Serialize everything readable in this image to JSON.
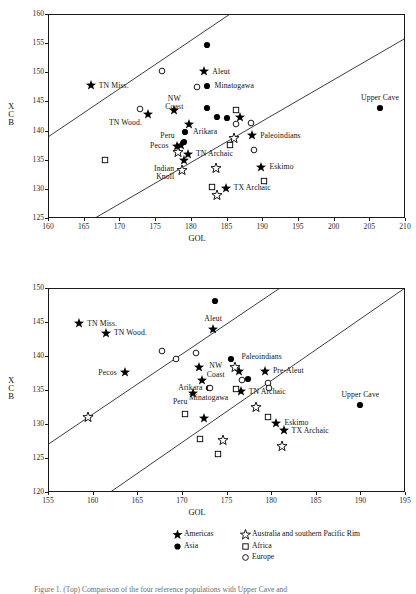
{
  "figure": {
    "caption_partial": "Figure 1. (Top) Comparison of the four reference populations with Upper Cave and"
  },
  "legend": {
    "entries": [
      {
        "label": "Americas",
        "marker": "filled-star",
        "color": "#000000"
      },
      {
        "label": "Asia",
        "marker": "filled-circle",
        "color": "#000000"
      },
      {
        "label": "Australia and southern Pacific Rim",
        "marker": "open-star",
        "color": "#000000"
      },
      {
        "label": "Africa",
        "marker": "open-square",
        "color": "#000000"
      },
      {
        "label": "Europe",
        "marker": "open-circle",
        "color": "#000000"
      }
    ]
  },
  "chart_data": [
    {
      "type": "scatter",
      "id": "top-panel",
      "title": "",
      "xlabel": "GOL",
      "ylabel": "XCB",
      "xlim": [
        160,
        210
      ],
      "ylim": [
        125,
        160
      ],
      "xticks": [
        160,
        165,
        170,
        175,
        180,
        185,
        190,
        195,
        200,
        205,
        210
      ],
      "yticks": [
        125,
        130,
        135,
        140,
        145,
        150,
        155,
        160
      ],
      "grid": false,
      "legend_position": "below-figure",
      "reference_lines": [
        {
          "name": "upper-boundary",
          "x0": 160,
          "y0": 138.9,
          "x1": 185.5,
          "y1": 160.0
        },
        {
          "name": "lower-boundary",
          "x0": 166.6,
          "y0": 125.0,
          "x1": 210.0,
          "y1": 155.8
        }
      ],
      "series": [
        {
          "name": "Americas",
          "marker": "filled-star",
          "points": [
            {
              "x": 166.0,
              "y": 147.8,
              "label": "TN Miss.",
              "label_pos": "right"
            },
            {
              "x": 174.0,
              "y": 142.8,
              "label": "TN Wood.",
              "label_pos": "belowleft"
            },
            {
              "x": 181.9,
              "y": 150.2,
              "label": "Aleut",
              "label_pos": "right"
            },
            {
              "x": 177.7,
              "y": 143.5,
              "label": "NW Coast",
              "label_pos": "above"
            },
            {
              "x": 186.9,
              "y": 142.3,
              "label": "Pre-Aleut",
              "label_pos": "none"
            },
            {
              "x": 188.6,
              "y": 139.2,
              "label": "Paleoindians",
              "label_pos": "right"
            },
            {
              "x": 179.7,
              "y": 141.1,
              "label": "",
              "label_pos": "none"
            },
            {
              "x": 178.0,
              "y": 137.4,
              "label": "Pecos",
              "label_pos": "left"
            },
            {
              "x": 178.6,
              "y": 137.5,
              "label": "Peru",
              "label_pos": "aboveleft"
            },
            {
              "x": 179.6,
              "y": 136.0,
              "label": "TN Archaic",
              "label_pos": "right"
            },
            {
              "x": 179.1,
              "y": 134.9,
              "label": "",
              "label_pos": "none"
            },
            {
              "x": 189.9,
              "y": 133.8,
              "label": "Eskimo",
              "label_pos": "right"
            },
            {
              "x": 184.9,
              "y": 130.2,
              "label": "TX Archaic",
              "label_pos": "right"
            }
          ]
        },
        {
          "name": "Asia",
          "marker": "filled-circle",
          "points": [
            {
              "x": 182.3,
              "y": 154.7,
              "label": "",
              "label_pos": "none"
            },
            {
              "x": 182.2,
              "y": 147.7,
              "label": "Minatogawa",
              "label_pos": "right"
            },
            {
              "x": 182.2,
              "y": 143.8,
              "label": "",
              "label_pos": "none"
            },
            {
              "x": 183.7,
              "y": 142.3,
              "label": "",
              "label_pos": "none"
            },
            {
              "x": 185.0,
              "y": 142.2,
              "label": "",
              "label_pos": "none"
            },
            {
              "x": 179.2,
              "y": 139.8,
              "label": "Arikara",
              "label_pos": "right"
            },
            {
              "x": 179.1,
              "y": 138.1,
              "label": "",
              "label_pos": "none"
            },
            {
              "x": 206.5,
              "y": 143.9,
              "label": "Upper Cave",
              "label_pos": "above"
            }
          ]
        },
        {
          "name": "Australia and southern Pacific Rim",
          "marker": "open-star",
          "points": [
            {
              "x": 178.2,
              "y": 136.4,
              "label": "",
              "label_pos": "none"
            },
            {
              "x": 178.8,
              "y": 133.3,
              "label": "Indian Knoll",
              "label_pos": "left"
            },
            {
              "x": 186.0,
              "y": 138.8,
              "label": "",
              "label_pos": "none"
            },
            {
              "x": 183.5,
              "y": 133.5,
              "label": "",
              "label_pos": "none"
            },
            {
              "x": 183.6,
              "y": 128.9,
              "label": "",
              "label_pos": "none"
            }
          ]
        },
        {
          "name": "Africa",
          "marker": "open-square",
          "points": [
            {
              "x": 168.0,
              "y": 134.9,
              "label": "",
              "label_pos": "none"
            },
            {
              "x": 186.4,
              "y": 143.6,
              "label": "",
              "label_pos": "none"
            },
            {
              "x": 185.5,
              "y": 137.5,
              "label": "",
              "label_pos": "none"
            },
            {
              "x": 190.2,
              "y": 131.4,
              "label": "",
              "label_pos": "none"
            },
            {
              "x": 183.0,
              "y": 130.3,
              "label": "",
              "label_pos": "none"
            }
          ]
        },
        {
          "name": "Europe",
          "marker": "open-circle",
          "points": [
            {
              "x": 176.0,
              "y": 150.3,
              "label": "",
              "label_pos": "none"
            },
            {
              "x": 180.9,
              "y": 147.4,
              "label": "",
              "label_pos": "none"
            },
            {
              "x": 172.9,
              "y": 143.7,
              "label": "",
              "label_pos": "none"
            },
            {
              "x": 186.3,
              "y": 141.1,
              "label": "",
              "label_pos": "none"
            },
            {
              "x": 188.4,
              "y": 141.3,
              "label": "",
              "label_pos": "none"
            },
            {
              "x": 188.8,
              "y": 136.7,
              "label": "",
              "label_pos": "none"
            }
          ]
        }
      ]
    },
    {
      "type": "scatter",
      "id": "bottom-panel",
      "title": "",
      "xlabel": "GOL",
      "ylabel": "XCB",
      "xlim": [
        155,
        195
      ],
      "ylim": [
        120,
        150
      ],
      "xticks": [
        155,
        160,
        165,
        170,
        175,
        180,
        185,
        190,
        195
      ],
      "yticks": [
        120,
        125,
        130,
        135,
        140,
        145,
        150
      ],
      "grid": false,
      "legend_position": "below",
      "reference_lines": [
        {
          "name": "upper-boundary",
          "x0": 155.0,
          "y0": 127.0,
          "x1": 181.0,
          "y1": 150.0
        },
        {
          "name": "lower-boundary",
          "x0": 162.0,
          "y0": 120.0,
          "x1": 195.0,
          "y1": 150.0
        }
      ],
      "series": [
        {
          "name": "Americas",
          "marker": "filled-star",
          "points": [
            {
              "x": 158.5,
              "y": 144.8,
              "label": "TN Miss.",
              "label_pos": "right"
            },
            {
              "x": 161.5,
              "y": 143.4,
              "label": "TN Wood.",
              "label_pos": "right"
            },
            {
              "x": 173.5,
              "y": 143.9,
              "label": "Aleut",
              "label_pos": "above"
            },
            {
              "x": 171.9,
              "y": 138.4,
              "label": "NW Coast",
              "label_pos": "right"
            },
            {
              "x": 163.6,
              "y": 137.6,
              "label": "Pecos",
              "label_pos": "left"
            },
            {
              "x": 172.2,
              "y": 136.4,
              "label": "",
              "label_pos": "none"
            },
            {
              "x": 171.3,
              "y": 134.6,
              "label": "Peru",
              "label_pos": "belowleft"
            },
            {
              "x": 176.4,
              "y": 137.8,
              "label": "",
              "label_pos": "none"
            },
            {
              "x": 179.3,
              "y": 137.8,
              "label": "Pre-Aleut",
              "label_pos": "right"
            },
            {
              "x": 176.6,
              "y": 134.8,
              "label": "TN Archaic",
              "label_pos": "right"
            },
            {
              "x": 172.5,
              "y": 130.9,
              "label": "",
              "label_pos": "none"
            },
            {
              "x": 180.6,
              "y": 130.2,
              "label": "Eskimo",
              "label_pos": "right"
            },
            {
              "x": 181.4,
              "y": 129.1,
              "label": "TX Archaic",
              "label_pos": "right"
            }
          ]
        },
        {
          "name": "Asia",
          "marker": "filled-circle",
          "points": [
            {
              "x": 173.7,
              "y": 148.1,
              "label": "",
              "label_pos": "none"
            },
            {
              "x": 175.5,
              "y": 139.6,
              "label": "",
              "label_pos": "none"
            },
            {
              "x": 177.4,
              "y": 136.6,
              "label": "",
              "label_pos": "none"
            },
            {
              "x": 173.0,
              "y": 135.3,
              "label": "Minatogawa",
              "label_pos": "below"
            },
            {
              "x": 190.0,
              "y": 132.8,
              "label": "Upper Cave",
              "label_pos": "above"
            }
          ]
        },
        {
          "name": "Australia and southern Pacific Rim",
          "marker": "open-star",
          "points": [
            {
              "x": 159.5,
              "y": 131.1,
              "label": "",
              "label_pos": "none"
            },
            {
              "x": 176.0,
              "y": 138.4,
              "label": "Paleoindians",
              "label_pos": "aboveright"
            },
            {
              "x": 178.3,
              "y": 132.5,
              "label": "",
              "label_pos": "none"
            },
            {
              "x": 174.6,
              "y": 127.7,
              "label": "",
              "label_pos": "none"
            },
            {
              "x": 181.2,
              "y": 126.7,
              "label": "",
              "label_pos": "none"
            }
          ]
        },
        {
          "name": "Africa",
          "marker": "open-square",
          "points": [
            {
              "x": 170.3,
              "y": 131.5,
              "label": "",
              "label_pos": "none"
            },
            {
              "x": 176.1,
              "y": 135.2,
              "label": "",
              "label_pos": "none"
            },
            {
              "x": 179.6,
              "y": 131.1,
              "label": "",
              "label_pos": "none"
            },
            {
              "x": 172.0,
              "y": 127.8,
              "label": "",
              "label_pos": "none"
            },
            {
              "x": 174.0,
              "y": 125.6,
              "label": "",
              "label_pos": "none"
            }
          ]
        },
        {
          "name": "Europe",
          "marker": "open-circle",
          "points": [
            {
              "x": 167.8,
              "y": 140.7,
              "label": "",
              "label_pos": "none"
            },
            {
              "x": 171.6,
              "y": 140.4,
              "label": "",
              "label_pos": "none"
            },
            {
              "x": 169.3,
              "y": 139.5,
              "label": "",
              "label_pos": "none"
            },
            {
              "x": 176.7,
              "y": 136.5,
              "label": "",
              "label_pos": "none"
            },
            {
              "x": 179.7,
              "y": 136.0,
              "label": "",
              "label_pos": "none"
            },
            {
              "x": 179.8,
              "y": 135.3,
              "label": "",
              "label_pos": "none"
            },
            {
              "x": 173.2,
              "y": 135.3,
              "label": "Arikara",
              "label_pos": "left"
            }
          ]
        }
      ]
    }
  ]
}
